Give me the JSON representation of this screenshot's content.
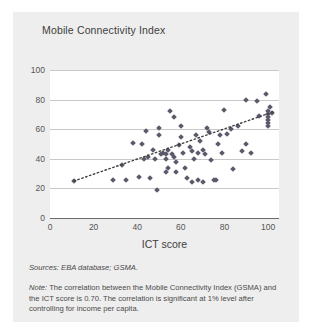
{
  "figure": {
    "title": "Mobile Connectivity Index",
    "sources": "Sources: EBA database; GSMA.",
    "note_prefix": "Note:",
    "note": " The correlation between the Mobile Connectivity Index (GSMA) and the ICT score is 0.70. The correlation is significant at 1% level after controlling for income per capita.",
    "background_color": "#eeeeee",
    "plot_background_color": "#ffffff",
    "marker_color": "#5a5a6b",
    "gridline_color": "#c9c9c9"
  },
  "chart_data": {
    "type": "scatter",
    "title": "Mobile Connectivity Index",
    "xlabel": "ICT score",
    "ylabel": "",
    "xlim": [
      0,
      105
    ],
    "ylim": [
      0,
      100
    ],
    "xticks": [
      0,
      20,
      40,
      60,
      80,
      100
    ],
    "yticks": [
      0,
      20,
      40,
      60,
      80,
      100
    ],
    "grid": true,
    "legend": "none",
    "correlation": 0.7,
    "trendline": {
      "type": "linear",
      "style": "dotted",
      "x_start": 11,
      "y_start": 25,
      "x_end": 103,
      "y_end": 72
    },
    "points": [
      [
        11,
        25
      ],
      [
        29,
        26
      ],
      [
        33,
        36
      ],
      [
        35,
        26
      ],
      [
        38,
        51
      ],
      [
        41,
        28
      ],
      [
        42,
        50
      ],
      [
        43,
        40
      ],
      [
        44,
        59
      ],
      [
        45,
        41
      ],
      [
        46,
        27
      ],
      [
        47,
        46
      ],
      [
        48,
        40
      ],
      [
        49,
        19
      ],
      [
        50,
        61
      ],
      [
        50,
        56
      ],
      [
        51,
        43
      ],
      [
        52,
        44
      ],
      [
        53,
        43
      ],
      [
        53,
        40
      ],
      [
        53,
        31
      ],
      [
        54,
        46
      ],
      [
        54,
        34
      ],
      [
        55,
        72
      ],
      [
        56,
        43
      ],
      [
        57,
        68
      ],
      [
        57,
        41
      ],
      [
        58,
        38
      ],
      [
        58,
        31
      ],
      [
        59,
        49
      ],
      [
        60,
        62
      ],
      [
        60,
        55
      ],
      [
        61,
        44
      ],
      [
        62,
        34
      ],
      [
        63,
        27
      ],
      [
        64,
        48
      ],
      [
        65,
        24
      ],
      [
        65,
        45
      ],
      [
        66,
        40
      ],
      [
        67,
        56
      ],
      [
        68,
        26
      ],
      [
        68,
        44
      ],
      [
        69,
        52
      ],
      [
        70,
        46
      ],
      [
        70,
        24
      ],
      [
        71,
        43
      ],
      [
        72,
        61
      ],
      [
        73,
        58
      ],
      [
        74,
        39
      ],
      [
        75,
        26
      ],
      [
        76,
        26
      ],
      [
        77,
        50
      ],
      [
        78,
        56
      ],
      [
        79,
        44
      ],
      [
        80,
        73
      ],
      [
        81,
        57
      ],
      [
        83,
        60
      ],
      [
        84,
        33
      ],
      [
        86,
        62
      ],
      [
        88,
        45
      ],
      [
        90,
        80
      ],
      [
        90,
        50
      ],
      [
        92,
        44
      ],
      [
        95,
        79
      ],
      [
        96,
        69
      ],
      [
        99,
        84
      ],
      [
        100,
        72
      ],
      [
        100,
        70
      ],
      [
        100,
        68
      ],
      [
        100,
        66
      ],
      [
        100,
        64
      ],
      [
        100,
        62
      ],
      [
        101,
        75
      ],
      [
        102,
        71
      ]
    ]
  }
}
